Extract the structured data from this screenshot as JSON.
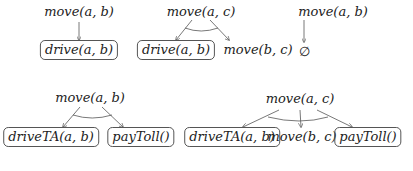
{
  "diagram": {
    "title": "",
    "trees": [
      {
        "root": {
          "label": "move(a, b)",
          "x": 79,
          "y": 6
        },
        "children": [
          {
            "label": "drive(a, b)",
            "x": 79,
            "y": 41,
            "boxed": true
          }
        ],
        "ordered_arc": false
      },
      {
        "root": {
          "label": "move(a, c)",
          "x": 201,
          "y": 6
        },
        "children": [
          {
            "label": "drive(a, b)",
            "x": 176,
            "y": 41,
            "boxed": true
          },
          {
            "label": "move(b, c)",
            "x": 258,
            "y": 41,
            "boxed": false
          }
        ],
        "ordered_arc": true
      },
      {
        "root": {
          "label": "move(a, b)",
          "x": 333,
          "y": 6
        },
        "children": [
          {
            "label": "∅",
            "x": 304,
            "y": 41,
            "boxed": false
          }
        ],
        "ordered_arc": false
      },
      {
        "root": {
          "label": "move(a, b)",
          "x": 90,
          "y": 91
        },
        "children": [
          {
            "label": "driveTA(a, b)",
            "x": 51,
            "y": 128,
            "boxed": true
          },
          {
            "label": "payToll()",
            "x": 141,
            "y": 128,
            "boxed": true
          }
        ],
        "ordered_arc": true
      },
      {
        "root": {
          "label": "move(a, c)",
          "x": 300,
          "y": 91
        },
        "children": [
          {
            "label": "driveTA(a, b)",
            "x": 232,
            "y": 128,
            "boxed": true
          },
          {
            "label": "move(b, c)",
            "x": 302,
            "y": 128,
            "boxed": false
          },
          {
            "label": "payToll()",
            "x": 368,
            "y": 128,
            "boxed": true
          }
        ],
        "ordered_arc": true
      }
    ],
    "colors": {
      "line": "#555555",
      "text": "#222222",
      "background": "#ffffff"
    }
  }
}
